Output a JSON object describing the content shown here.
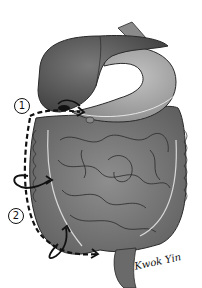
{
  "figure": {
    "labels": [
      {
        "id": "1",
        "text": "1"
      },
      {
        "id": "2",
        "text": "2"
      }
    ],
    "signature": "Kwok Yin",
    "colors": {
      "liver": "#5e5e5e",
      "liver_dark": "#4a4a4a",
      "stomach": "#9a9a9a",
      "intestine": "#7a7a7a",
      "outline": "#2a2a2a",
      "dash": "#111111"
    }
  }
}
